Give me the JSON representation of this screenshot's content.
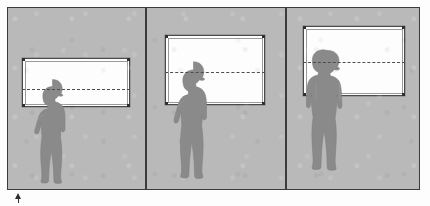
{
  "diagram": {
    "type": "architectural-elevation",
    "outer_frame": {
      "x": 7,
      "y": 7,
      "width": 413,
      "height": 183,
      "border_color": "#3b3b3b"
    },
    "colors": {
      "wall": "#b9b9b9",
      "window_glass": "#fdfdfd",
      "window_frame": "#4a4a4a",
      "figure": "#8a8a8a",
      "figure_outline": "#7c7c7c",
      "sightline": "#4d4d4d",
      "divider": "#3c3c3c",
      "marker": "#2e2e2e"
    },
    "dividers": [
      {
        "name": "divider-left",
        "x": 145
      },
      {
        "name": "divider-right",
        "x": 285
      }
    ],
    "panels": [
      {
        "id": "panel-1",
        "label": "Bay 1 — low sill",
        "x": 8,
        "width": 137,
        "window": {
          "x": 22,
          "y": 57,
          "width": 108,
          "height": 49
        },
        "sightline": {
          "x": 22,
          "y": 88,
          "width": 108
        },
        "figure": {
          "name": "standing-person-hand-on-hip",
          "x": 32,
          "y": 77,
          "width": 40,
          "height": 106
        }
      },
      {
        "id": "panel-2",
        "label": "Bay 2 — raised sill",
        "x": 147,
        "width": 138,
        "window": {
          "x": 165,
          "y": 34,
          "width": 100,
          "height": 70
        },
        "sightline": {
          "x": 165,
          "y": 71,
          "width": 100
        },
        "figure": {
          "name": "standing-person-hand-on-hip",
          "x": 172,
          "y": 59,
          "width": 42,
          "height": 124
        }
      },
      {
        "id": "panel-3",
        "label": "Bay 3 — high sill",
        "x": 287,
        "width": 132,
        "window": {
          "x": 303,
          "y": 25,
          "width": 102,
          "height": 70
        },
        "sightline": {
          "x": 303,
          "y": 61,
          "width": 102
        },
        "figure": {
          "name": "standing-person-suit",
          "x": 303,
          "y": 48,
          "width": 46,
          "height": 135
        }
      }
    ],
    "marker": {
      "name": "scale-arrow-marker",
      "x": 15,
      "y": 193
    }
  }
}
